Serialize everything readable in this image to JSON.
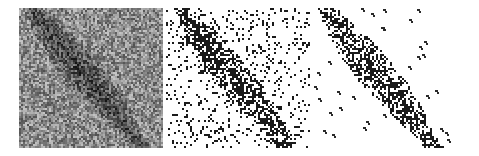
{
  "figure": {
    "panel_count": 3,
    "panels": [
      {
        "id": "noisy",
        "description": "Grayscale speckled radar-like image with dark diagonal band from upper-left to lower-right",
        "background": "#8a8a8a",
        "band_color": "#3a3a3a"
      },
      {
        "id": "thresholded",
        "description": "Binary thresholded image: white background with scattered black noise dots and dense dark diagonal band",
        "background": "#ffffff",
        "band_color": "#1a1a1a"
      },
      {
        "id": "filtered",
        "description": "Cleaned binary image: white background with dark diagonal band and few remaining small clusters",
        "background": "#ffffff",
        "band_color": "#1a1a1a"
      }
    ]
  }
}
